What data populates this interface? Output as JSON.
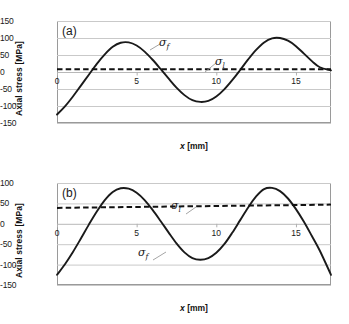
{
  "figure": {
    "background": "#ffffff",
    "curve_color": "#1a1a1a",
    "limit_color": "#111111",
    "grid_color": "#c9c9c9"
  },
  "chart_data": [
    {
      "type": "line",
      "panel": "(a)",
      "title": "",
      "xlabel": "x [mm]",
      "ylabel": "Axial stress [MPa]",
      "xlim": [
        0,
        17.2
      ],
      "ylim": [
        -150,
        150
      ],
      "xticks": [
        0,
        5,
        10,
        15
      ],
      "yticks": [
        150,
        100,
        50,
        0,
        -50,
        -100,
        -150
      ],
      "xtick_labels": [
        "0",
        "5",
        "10",
        "15"
      ],
      "ytick_labels": [
        "150",
        "100",
        "50",
        "0",
        "-50",
        "-100",
        "-150"
      ],
      "grid": true,
      "legend": "none",
      "series": [
        {
          "name": "sigma_f",
          "label": "σ",
          "sublabel": "f",
          "style": "solid",
          "x": [
            0,
            0.5,
            1,
            1.5,
            2,
            2.5,
            3,
            3.5,
            4,
            4.5,
            5,
            5.5,
            6,
            6.5,
            7,
            7.5,
            8,
            8.5,
            9,
            9.5,
            10,
            10.5,
            11,
            11.5,
            12,
            12.5,
            13,
            13.5,
            14,
            14.5,
            15,
            15.5,
            16,
            16.5,
            17.2
          ],
          "values": [
            -125,
            -101,
            -72,
            -40,
            -8,
            24,
            52,
            74,
            86,
            87,
            78,
            60,
            36,
            9,
            -19,
            -46,
            -68,
            -83,
            -88,
            -85,
            -72,
            -51,
            -24,
            6,
            37,
            65,
            87,
            99,
            100,
            92,
            76,
            54,
            32,
            14,
            5
          ]
        },
        {
          "name": "sigma_l",
          "label": "σ",
          "sublabel": "l",
          "style": "dashed",
          "x": [
            0,
            17.2
          ],
          "values": [
            8,
            8
          ]
        }
      ],
      "annotations": [
        {
          "text": "σ",
          "sub": "f",
          "x": 5.9,
          "y": 72
        },
        {
          "text": "σ",
          "sub": "l",
          "x": 9.4,
          "y": 40
        }
      ]
    },
    {
      "type": "line",
      "panel": "(b)",
      "title": "",
      "xlabel": "x [mm]",
      "ylabel": "Axial stress [MPa]",
      "xlim": [
        0,
        17.2
      ],
      "ylim": [
        -150,
        100
      ],
      "xticks": [
        0,
        5,
        10,
        15
      ],
      "yticks": [
        100,
        50,
        0,
        -50,
        -100,
        -150
      ],
      "xtick_labels": [
        "0",
        "5",
        "10",
        "15"
      ],
      "ytick_labels": [
        "100",
        "50",
        "0",
        "-50",
        "-100",
        "-150"
      ],
      "grid": true,
      "legend": "none",
      "series": [
        {
          "name": "sigma_f",
          "label": "σ",
          "sublabel": "f",
          "style": "solid",
          "x": [
            0,
            0.5,
            1,
            1.5,
            2,
            2.5,
            3,
            3.5,
            4,
            4.5,
            5,
            5.5,
            6,
            6.5,
            7,
            7.5,
            8,
            8.5,
            9,
            9.5,
            10,
            10.5,
            11,
            11.5,
            12,
            12.5,
            13,
            13.5,
            14,
            14.5,
            15,
            15.5,
            16,
            16.5,
            17.2
          ],
          "values": [
            -125,
            -99,
            -69,
            -36,
            -2,
            30,
            58,
            78,
            87,
            86,
            76,
            58,
            34,
            7,
            -21,
            -48,
            -70,
            -84,
            -88,
            -84,
            -71,
            -50,
            -22,
            9,
            40,
            67,
            85,
            88,
            80,
            62,
            36,
            5,
            -30,
            -66,
            -125
          ]
        },
        {
          "name": "sigma_l",
          "label": "σ",
          "sublabel": "l",
          "style": "dashed",
          "x": [
            0,
            17.2
          ],
          "values": [
            39,
            47
          ]
        }
      ],
      "annotations": [
        {
          "text": "σ",
          "sub": "l",
          "x": 8.0,
          "y": 18
        },
        {
          "text": "σ",
          "sub": "f",
          "x": 5.7,
          "y": -82
        }
      ]
    }
  ]
}
